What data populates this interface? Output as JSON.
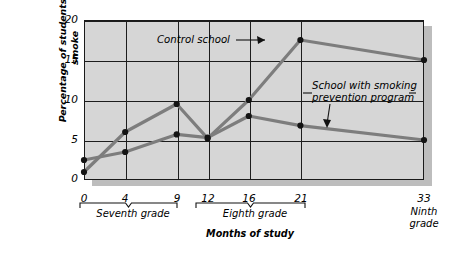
{
  "chart_data": {
    "type": "line",
    "title": "",
    "xlabel": "Months of study",
    "ylabel": "Percentage of students who smoke",
    "x": [
      0,
      4,
      9,
      12,
      16,
      21,
      33
    ],
    "xtick_labels": [
      "0",
      "4",
      "9",
      "12",
      "16",
      "21",
      "33"
    ],
    "ytick_labels": [
      "0",
      "5",
      "10",
      "15",
      "20"
    ],
    "yticks": [
      0,
      5,
      10,
      15,
      20
    ],
    "ylim": [
      0,
      20
    ],
    "xlim": [
      0,
      33
    ],
    "grid": "both",
    "legend": "annotations",
    "series": [
      {
        "name": "Control school",
        "values": [
          1.0,
          6.0,
          9.5,
          5.2,
          10.0,
          17.5,
          15.0
        ]
      },
      {
        "name": "School with smoking prevention program",
        "values": [
          2.5,
          3.5,
          5.7,
          5.3,
          8.0,
          6.8,
          5.0
        ]
      }
    ],
    "annotations": [
      {
        "text": "Control school",
        "target_series": "Control school"
      },
      {
        "text": "School with smoking\nprevention program",
        "target_series": "School with smoking prevention program"
      }
    ],
    "x_group_labels": [
      {
        "label": "Seventh grade",
        "from": 0,
        "to": 9
      },
      {
        "label": "Eighth grade",
        "from": 12,
        "to": 21
      },
      {
        "label": "Ninth\ngrade",
        "from": 33,
        "to": 33
      }
    ],
    "colors": {
      "line": "#7d7d7d",
      "marker": "#141414",
      "plot_background": "#d6d6d6",
      "axis": "#1a1a1a",
      "shadow": "#bdbdbd"
    }
  }
}
